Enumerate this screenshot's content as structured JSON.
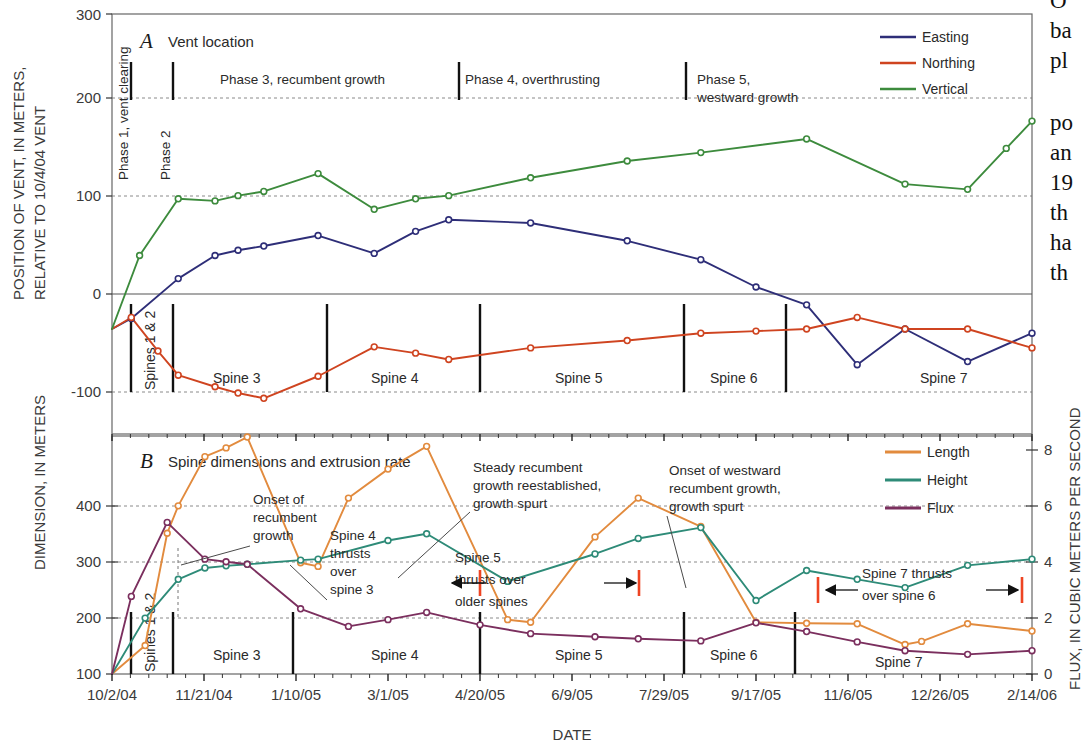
{
  "figure": {
    "panel_a": {
      "letter": "A",
      "title": "Vent location",
      "y_axis_label_line1": "POSITION OF VENT, IN METERS,",
      "y_axis_label_line2": "RELATIVE TO 10/4/04 VENT",
      "y_ticks": [
        "300",
        "200",
        "100",
        "0",
        "-100"
      ],
      "legend": [
        {
          "label": "Easting",
          "color": "#2e2e78"
        },
        {
          "label": "Northing",
          "color": "#cf4420"
        },
        {
          "label": "Vertical",
          "color": "#3d8b3d"
        }
      ],
      "phases": [
        {
          "label": "Phase 1, vent clearing",
          "orientation": "vertical"
        },
        {
          "label": "Phase 2",
          "orientation": "vertical"
        },
        {
          "label": "Phase 3, recumbent growth",
          "orientation": "horizontal"
        },
        {
          "label": "Phase 4, overthrusting",
          "orientation": "horizontal"
        },
        {
          "label": "Phase 5,",
          "label2": "westward growth",
          "orientation": "horizontal"
        }
      ],
      "spine_labels": [
        "Spines 1 & 2",
        "Spine 3",
        "Spine 4",
        "Spine 5",
        "Spine 6",
        "Spine 7"
      ]
    },
    "panel_b": {
      "letter": "B",
      "title": "Spine dimensions and extrusion rate",
      "y_axis_label": "DIMENSION, IN METERS",
      "y_ticks": [
        "400",
        "300",
        "200",
        "100",
        "0"
      ],
      "y2_axis_label": "FLUX, IN CUBIC METERS PER SECOND",
      "y2_ticks": [
        "8",
        "6",
        "4",
        "2",
        "0"
      ],
      "legend": [
        {
          "label": "Length",
          "color": "#e28b3e"
        },
        {
          "label": "Height",
          "color": "#2e8b78"
        },
        {
          "label": "Flux",
          "color": "#7b2f5e"
        }
      ],
      "spine_labels": [
        "Spines 1 & 2",
        "Spine 3",
        "Spine 4",
        "Spine 5",
        "Spine 6",
        "Spine 7"
      ],
      "annotations": [
        {
          "id": "onset-recumbent",
          "lines": [
            "Onset of",
            "recumbent",
            "growth"
          ]
        },
        {
          "id": "spine4-thrusts",
          "lines": [
            "Spine 4",
            "thrusts",
            "over",
            "spine 3"
          ]
        },
        {
          "id": "steady-recumbent",
          "lines": [
            "Steady recumbent",
            "growth reestablished,",
            "growth spurt"
          ]
        },
        {
          "id": "spine5-thrusts",
          "lines": [
            "Spine 5",
            "thrusts over",
            "older spines"
          ]
        },
        {
          "id": "onset-westward",
          "lines": [
            "Onset of westward",
            "recumbent growth,",
            "growth spurt"
          ]
        },
        {
          "id": "spine7-thrusts",
          "lines": [
            "Spine 7 thrusts",
            "over spine 6"
          ]
        }
      ]
    },
    "x_axis": {
      "label": "DATE",
      "ticks": [
        "10/2/04",
        "11/21/04",
        "1/10/05",
        "3/1/05",
        "4/20/05",
        "6/9/05",
        "7/29/05",
        "9/17/05",
        "11/6/05",
        "12/26/05",
        "2/14/06"
      ]
    },
    "side_text_fragments": [
      "O",
      "ba",
      "pl",
      "po",
      "an",
      "19",
      "th",
      "ha",
      "th"
    ]
  },
  "chart_data": [
    {
      "type": "line",
      "id": "panel-a-vent-location",
      "title": "Vent location",
      "xlabel": "DATE",
      "ylabel": "POSITION OF VENT, IN METERS, RELATIVE TO 10/4/04 VENT",
      "ylim": [
        -100,
        300
      ],
      "yticks": [
        -100,
        0,
        100,
        200,
        300
      ],
      "xlim": [
        "10/2/04",
        "2/14/06"
      ],
      "xticks": [
        "10/2/04",
        "11/21/04",
        "1/10/05",
        "3/1/05",
        "4/20/05",
        "6/9/05",
        "7/29/05",
        "9/17/05",
        "11/6/05",
        "12/26/05",
        "2/14/06"
      ],
      "grid": true,
      "legend_position": "top-right",
      "series": [
        {
          "name": "Easting",
          "color": "#2e2e78",
          "points": [
            {
              "x": 0.0,
              "y": 0
            },
            {
              "x": 0.021,
              "y": 10
            },
            {
              "x": 0.072,
              "y": 48
            },
            {
              "x": 0.112,
              "y": 70
            },
            {
              "x": 0.137,
              "y": 75
            },
            {
              "x": 0.165,
              "y": 79
            },
            {
              "x": 0.224,
              "y": 89
            },
            {
              "x": 0.285,
              "y": 72
            },
            {
              "x": 0.33,
              "y": 93
            },
            {
              "x": 0.366,
              "y": 104
            },
            {
              "x": 0.455,
              "y": 101
            },
            {
              "x": 0.56,
              "y": 84
            },
            {
              "x": 0.64,
              "y": 66
            },
            {
              "x": 0.7,
              "y": 40
            },
            {
              "x": 0.755,
              "y": 23
            },
            {
              "x": 0.81,
              "y": -34
            },
            {
              "x": 0.862,
              "y": 0
            },
            {
              "x": 0.93,
              "y": -31
            },
            {
              "x": 1.0,
              "y": -4
            }
          ]
        },
        {
          "name": "Northing",
          "color": "#cf4420",
          "points": [
            {
              "x": 0.0,
              "y": 0
            },
            {
              "x": 0.021,
              "y": 11
            },
            {
              "x": 0.05,
              "y": -21
            },
            {
              "x": 0.072,
              "y": -44
            },
            {
              "x": 0.112,
              "y": -55
            },
            {
              "x": 0.137,
              "y": -61
            },
            {
              "x": 0.165,
              "y": -66
            },
            {
              "x": 0.224,
              "y": -45
            },
            {
              "x": 0.285,
              "y": -17
            },
            {
              "x": 0.33,
              "y": -23
            },
            {
              "x": 0.366,
              "y": -29
            },
            {
              "x": 0.455,
              "y": -18
            },
            {
              "x": 0.56,
              "y": -11
            },
            {
              "x": 0.64,
              "y": -4
            },
            {
              "x": 0.7,
              "y": -2
            },
            {
              "x": 0.755,
              "y": 0
            },
            {
              "x": 0.81,
              "y": 11
            },
            {
              "x": 0.862,
              "y": 0
            },
            {
              "x": 0.93,
              "y": 0
            },
            {
              "x": 1.0,
              "y": -18
            }
          ]
        },
        {
          "name": "Vertical",
          "color": "#3d8b3d",
          "points": [
            {
              "x": 0.0,
              "y": 0
            },
            {
              "x": 0.03,
              "y": 70
            },
            {
              "x": 0.072,
              "y": 124
            },
            {
              "x": 0.112,
              "y": 122
            },
            {
              "x": 0.137,
              "y": 127
            },
            {
              "x": 0.165,
              "y": 131
            },
            {
              "x": 0.224,
              "y": 148
            },
            {
              "x": 0.285,
              "y": 114
            },
            {
              "x": 0.33,
              "y": 124
            },
            {
              "x": 0.366,
              "y": 127
            },
            {
              "x": 0.455,
              "y": 144
            },
            {
              "x": 0.56,
              "y": 160
            },
            {
              "x": 0.64,
              "y": 168
            },
            {
              "x": 0.755,
              "y": 181
            },
            {
              "x": 0.862,
              "y": 138
            },
            {
              "x": 0.93,
              "y": 133
            },
            {
              "x": 0.972,
              "y": 172
            },
            {
              "x": 1.0,
              "y": 198
            }
          ]
        }
      ]
    },
    {
      "type": "line",
      "id": "panel-b-spine-dimensions",
      "title": "Spine dimensions and extrusion rate",
      "xlabel": "DATE",
      "ylabel": "DIMENSION, IN METERS",
      "y2label": "FLUX, IN CUBIC METERS PER SECOND",
      "ylim": [
        0,
        460
      ],
      "yticks": [
        0,
        100,
        200,
        300,
        400
      ],
      "y2lim": [
        0,
        9.2
      ],
      "y2ticks": [
        0,
        2,
        4,
        6,
        8
      ],
      "grid": true,
      "legend_position": "top-right",
      "series": [
        {
          "name": "Length",
          "unit": "meters",
          "color": "#e28b3e",
          "points": [
            {
              "x": 0.0,
              "y": 0
            },
            {
              "x": 0.036,
              "y": 55
            },
            {
              "x": 0.06,
              "y": 272
            },
            {
              "x": 0.072,
              "y": 325
            },
            {
              "x": 0.101,
              "y": 420
            },
            {
              "x": 0.124,
              "y": 437
            },
            {
              "x": 0.147,
              "y": 458
            },
            {
              "x": 0.205,
              "y": 215
            },
            {
              "x": 0.224,
              "y": 208
            },
            {
              "x": 0.257,
              "y": 340
            },
            {
              "x": 0.3,
              "y": 396
            },
            {
              "x": 0.342,
              "y": 440
            },
            {
              "x": 0.43,
              "y": 105
            },
            {
              "x": 0.455,
              "y": 100
            },
            {
              "x": 0.525,
              "y": 265
            },
            {
              "x": 0.572,
              "y": 340
            },
            {
              "x": 0.64,
              "y": 285
            },
            {
              "x": 0.7,
              "y": 100
            },
            {
              "x": 0.755,
              "y": 98
            },
            {
              "x": 0.81,
              "y": 97
            },
            {
              "x": 0.862,
              "y": 57
            },
            {
              "x": 0.88,
              "y": 63
            },
            {
              "x": 0.93,
              "y": 97
            },
            {
              "x": 1.0,
              "y": 83
            }
          ]
        },
        {
          "name": "Height",
          "unit": "meters",
          "color": "#2e8b78",
          "points": [
            {
              "x": 0.0,
              "y": 0
            },
            {
              "x": 0.036,
              "y": 108
            },
            {
              "x": 0.072,
              "y": 183
            },
            {
              "x": 0.101,
              "y": 205
            },
            {
              "x": 0.124,
              "y": 209
            },
            {
              "x": 0.147,
              "y": 212
            },
            {
              "x": 0.205,
              "y": 220
            },
            {
              "x": 0.224,
              "y": 222
            },
            {
              "x": 0.3,
              "y": 258
            },
            {
              "x": 0.342,
              "y": 271
            },
            {
              "x": 0.43,
              "y": 179
            },
            {
              "x": 0.525,
              "y": 232
            },
            {
              "x": 0.572,
              "y": 262
            },
            {
              "x": 0.64,
              "y": 283
            },
            {
              "x": 0.7,
              "y": 142
            },
            {
              "x": 0.755,
              "y": 200
            },
            {
              "x": 0.81,
              "y": 183
            },
            {
              "x": 0.862,
              "y": 167
            },
            {
              "x": 0.93,
              "y": 210
            },
            {
              "x": 1.0,
              "y": 222
            }
          ]
        },
        {
          "name": "Flux",
          "unit": "cubic meters per second",
          "color": "#7b2f5e",
          "points": [
            {
              "x": 0.0,
              "y": 0
            },
            {
              "x": 0.021,
              "y": 150
            },
            {
              "x": 0.06,
              "y": 293
            },
            {
              "x": 0.101,
              "y": 222
            },
            {
              "x": 0.124,
              "y": 217
            },
            {
              "x": 0.147,
              "y": 212
            },
            {
              "x": 0.205,
              "y": 126
            },
            {
              "x": 0.257,
              "y": 92
            },
            {
              "x": 0.3,
              "y": 105
            },
            {
              "x": 0.342,
              "y": 119
            },
            {
              "x": 0.4,
              "y": 95
            },
            {
              "x": 0.455,
              "y": 78
            },
            {
              "x": 0.525,
              "y": 72
            },
            {
              "x": 0.572,
              "y": 68
            },
            {
              "x": 0.64,
              "y": 64
            },
            {
              "x": 0.7,
              "y": 99
            },
            {
              "x": 0.755,
              "y": 82
            },
            {
              "x": 0.81,
              "y": 62
            },
            {
              "x": 0.862,
              "y": 45
            },
            {
              "x": 0.93,
              "y": 38
            },
            {
              "x": 1.0,
              "y": 45
            }
          ]
        }
      ]
    }
  ]
}
